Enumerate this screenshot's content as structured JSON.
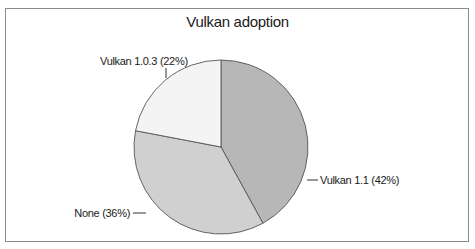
{
  "chart_data": {
    "type": "pie",
    "title": "Vulkan adoption",
    "categories": [
      "Vulkan 1.1",
      "None",
      "Vulkan 1.0.3"
    ],
    "values": [
      42,
      36,
      22
    ],
    "unit": "%",
    "labels": [
      "Vulkan 1.1 (42%)",
      "None (36%)",
      "Vulkan 1.0.3 (22%)"
    ],
    "colors": [
      "#b7b7b7",
      "#d0d0d0",
      "#f4f4f4"
    ],
    "start_angle": "12 o'clock",
    "direction": "clockwise",
    "legend": "none (callout labels)"
  },
  "labels": {
    "slice_1": "Vulkan 1.1 (42%)",
    "slice_2": "None (36%)",
    "slice_3": "Vulkan 1.0.3 (22%)"
  }
}
